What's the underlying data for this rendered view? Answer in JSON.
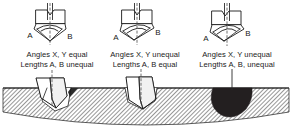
{
  "figure": {
    "colors": {
      "ink": "#1a1a1a",
      "hatch": "#1a1a1a",
      "hatch_background": "#ffffff",
      "dark_hole_fill": "#231f20",
      "centerline": "#4d4d4d",
      "page_background": "#ffffff"
    }
  },
  "cases": [
    {
      "id": "case-1",
      "point_label_left": "A",
      "point_label_right": "B",
      "caption_line1": "Angles X, Y equal",
      "caption_line2": "Lengths A, B unequal",
      "hole_description": "oversize-hole-drill-offset"
    },
    {
      "id": "case-2",
      "point_label_left": "A",
      "point_label_right": "B",
      "caption_line1": "Angles X, Y unequal",
      "caption_line2": "Lengths A, B equal",
      "hole_description": "near-size-hole-drill-seated"
    },
    {
      "id": "case-3",
      "point_label_left": "A",
      "point_label_right": "B",
      "caption_line1": "Angles X, Y unequal",
      "caption_line2": "Lengths A, B, unequal",
      "hole_description": "bellmouthed-oversize-hole-dark"
    }
  ]
}
